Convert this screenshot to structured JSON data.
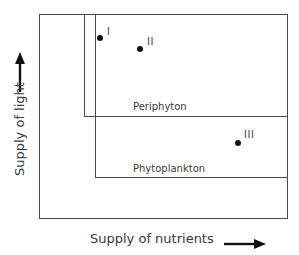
{
  "diagram": {
    "type": "nested-regions",
    "axes": {
      "x": {
        "label": "Supply of nutrients",
        "direction_icon": "arrow-right-icon"
      },
      "y": {
        "label": "Supply of light",
        "direction_icon": "arrow-up-icon"
      }
    },
    "regions": [
      {
        "id": "outer",
        "label": ""
      },
      {
        "id": "periphyton",
        "label": "Periphyton"
      },
      {
        "id": "phytoplankton",
        "label": "Phytoplankton"
      }
    ],
    "points": [
      {
        "id": "I",
        "label": "I",
        "region": "periphyton"
      },
      {
        "id": "II",
        "label": "II",
        "region": "periphyton"
      },
      {
        "id": "III",
        "label": "III",
        "region": "phytoplankton"
      }
    ],
    "colors": {
      "line": "#4a4a4a",
      "text": "#3a3a3a",
      "point": "#111111",
      "background": "#ffffff"
    }
  }
}
